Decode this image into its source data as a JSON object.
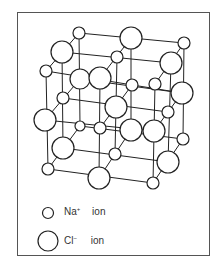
{
  "figure": {
    "legend": [
      {
        "symbol": "small-circle",
        "ion": "Na",
        "charge": "+",
        "label": "ion"
      },
      {
        "symbol": "large-circle",
        "ion": "Cl",
        "charge": "−",
        "label": "ion"
      }
    ]
  },
  "colors": {
    "stroke": "#222222",
    "fill": "#ffffff",
    "border": "#555555"
  }
}
